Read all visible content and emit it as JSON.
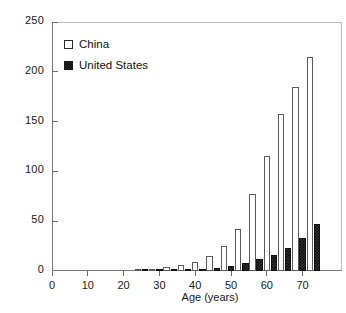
{
  "chart_data": {
    "type": "bar",
    "title": "",
    "xlabel": "Age (years)",
    "ylabel": "",
    "xlim": [
      0,
      78
    ],
    "ylim": [
      0,
      250
    ],
    "grid": false,
    "legend_position": "top-left",
    "xticks": [
      0,
      10,
      20,
      30,
      40,
      50,
      60,
      70
    ],
    "yticks": [
      0,
      50,
      100,
      150,
      200,
      250
    ],
    "categories": [
      25,
      29,
      33,
      37,
      41,
      45,
      49,
      53,
      57,
      61,
      65,
      69,
      73
    ],
    "series": [
      {
        "name": "China",
        "color": "#ffffff",
        "edge_color": "#5c5c5c",
        "values": [
          0.5,
          2,
          4,
          6,
          9,
          15,
          25,
          42,
          77,
          115,
          158,
          185,
          215
        ]
      },
      {
        "name": "United States",
        "color": "#2a2a2a",
        "edge_color": "#111111",
        "values": [
          0.2,
          0.4,
          0.8,
          1.2,
          2,
          3,
          5,
          8,
          12,
          16,
          23,
          33,
          47
        ]
      }
    ]
  },
  "legend": {
    "items": [
      {
        "label": "China",
        "swatch": "open-square-swatch"
      },
      {
        "label": "United States",
        "swatch": "filled-square-swatch"
      }
    ]
  },
  "axes": {
    "x_title": "Age (years)",
    "y_tick_labels": [
      "0",
      "50",
      "100",
      "150",
      "200",
      "250"
    ],
    "x_tick_labels": [
      "0",
      "10",
      "20",
      "30",
      "40",
      "50",
      "60",
      "70"
    ]
  }
}
